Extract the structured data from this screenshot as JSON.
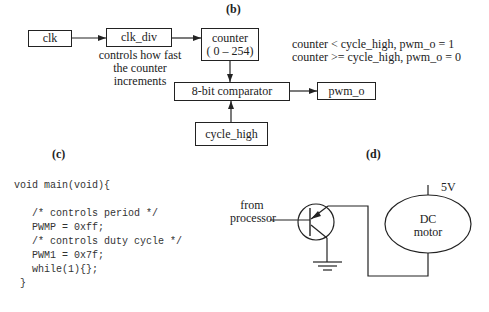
{
  "panel_b": {
    "label": "(b)",
    "blocks": {
      "clk": "clk",
      "clk_div": "clk_div",
      "counter_line1": "counter",
      "counter_line2": "( 0 – 254)",
      "comparator": "8-bit comparator",
      "pwm_o": "pwm_o",
      "cycle_high": "cycle_high"
    },
    "clk_div_note": [
      "controls how fast",
      "the counter",
      "increments"
    ],
    "rules": [
      "counter < cycle_high, pwm_o = 1",
      "counter >= cycle_high,  pwm_o = 0"
    ]
  },
  "panel_c": {
    "label": "(c)",
    "code_lines": [
      "void main(void){",
      "",
      "   /* controls period */",
      "   PWMP = 0xff;",
      "   /* controls duty cycle */",
      "   PWM1 = 0x7f;",
      "   while(1){};",
      " }"
    ]
  },
  "panel_d": {
    "label": "(d)",
    "input_label": [
      "from",
      "processor"
    ],
    "supply_label": "5V",
    "motor_label": [
      "DC",
      "motor"
    ]
  }
}
